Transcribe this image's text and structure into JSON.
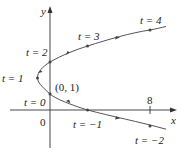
{
  "figure": {
    "type": "parametric-curve",
    "equations": {
      "x": "t^2 - 2t",
      "y": "t + 1"
    },
    "axes": {
      "x_label": "x",
      "y_label": "y",
      "origin_label": "0",
      "x_tick_label": "8"
    },
    "point_label": "(0, 1)",
    "parameter_labels": [
      {
        "t": -2,
        "text": "t = −2"
      },
      {
        "t": -1,
        "text": "t = −1"
      },
      {
        "t": 0,
        "text": "t = 0"
      },
      {
        "t": 1,
        "text": "t = 1"
      },
      {
        "t": 2,
        "text": "t = 2"
      },
      {
        "t": 3,
        "text": "t = 3"
      },
      {
        "t": 4,
        "text": "t = 4"
      }
    ],
    "colors": {
      "axis": "#333333",
      "curve": "#555555",
      "text": "#222222"
    }
  }
}
